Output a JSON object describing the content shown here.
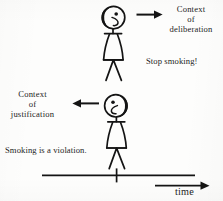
{
  "figure": {
    "background_color": "#fdfdfc",
    "ink_color": "#1a1a1a"
  },
  "labels": {
    "deliberation": "Context\nof\ndeliberation",
    "justification": "Context\nof\njustification",
    "stop_smoking": "Stop smoking!",
    "violation": "Smoking is a violation.",
    "time_axis": "time"
  },
  "arrows": {
    "upper_direction": "right",
    "lower_direction": "left",
    "time_direction": "right"
  },
  "figures": [
    {
      "name": "upper-stick-figure",
      "facing": "right",
      "utterance": "Stop smoking!",
      "context": "Context of deliberation"
    },
    {
      "name": "lower-stick-figure",
      "facing": "left",
      "utterance": "Smoking is a violation.",
      "context": "Context of justification"
    }
  ],
  "axis": {
    "orientation": "horizontal",
    "label": "time",
    "tick_count": 1
  }
}
